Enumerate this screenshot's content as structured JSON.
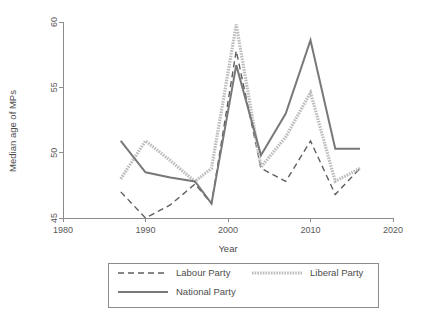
{
  "chart_data": {
    "type": "line",
    "title": "",
    "xlabel": "Year",
    "ylabel": "Median age of MPs",
    "xlim": [
      1980,
      2020
    ],
    "ylim": [
      45,
      60
    ],
    "xticks": [
      1980,
      1990,
      2000,
      2010,
      2020
    ],
    "xticklabels": [
      "1980",
      "1990",
      "2000",
      "2010",
      "2020"
    ],
    "yticks": [
      45,
      50,
      55,
      60
    ],
    "yticklabels": [
      "45",
      "50",
      "55",
      "60"
    ],
    "grid": false,
    "legend_position": "below",
    "series": [
      {
        "name": "Labour Party",
        "style": "dashed",
        "color": "#5f5f5f",
        "width": 1.4,
        "x": [
          1987,
          1990,
          1993,
          1996,
          1998,
          2001,
          2004,
          2007,
          2010,
          2013,
          2016
        ],
        "values": [
          47.0,
          45.0,
          46.0,
          47.6,
          46.1,
          57.8,
          48.8,
          47.8,
          50.9,
          46.8,
          48.8
        ]
      },
      {
        "name": "Liberal Party",
        "style": "dotted-thick",
        "color": "#bcbcbc",
        "width": 3.2,
        "x": [
          1987,
          1990,
          1993,
          1996,
          1998,
          2001,
          2004,
          2007,
          2010,
          2013,
          2016
        ],
        "values": [
          48.0,
          50.9,
          49.4,
          47.8,
          48.8,
          59.8,
          48.9,
          51.2,
          54.6,
          47.8,
          48.8
        ]
      },
      {
        "name": "National Party",
        "style": "solid",
        "color": "#787878",
        "width": 2.0,
        "x": [
          1987,
          1990,
          1993,
          1996,
          1998,
          2001,
          2004,
          2007,
          2010,
          2013,
          2016
        ],
        "values": [
          50.9,
          48.5,
          48.1,
          47.8,
          46.1,
          56.7,
          49.8,
          53.0,
          58.6,
          50.3,
          50.3
        ]
      }
    ]
  },
  "legend": {
    "entries": [
      {
        "label": "Labour Party"
      },
      {
        "label": "Liberal Party"
      },
      {
        "label": "National Party"
      }
    ]
  }
}
